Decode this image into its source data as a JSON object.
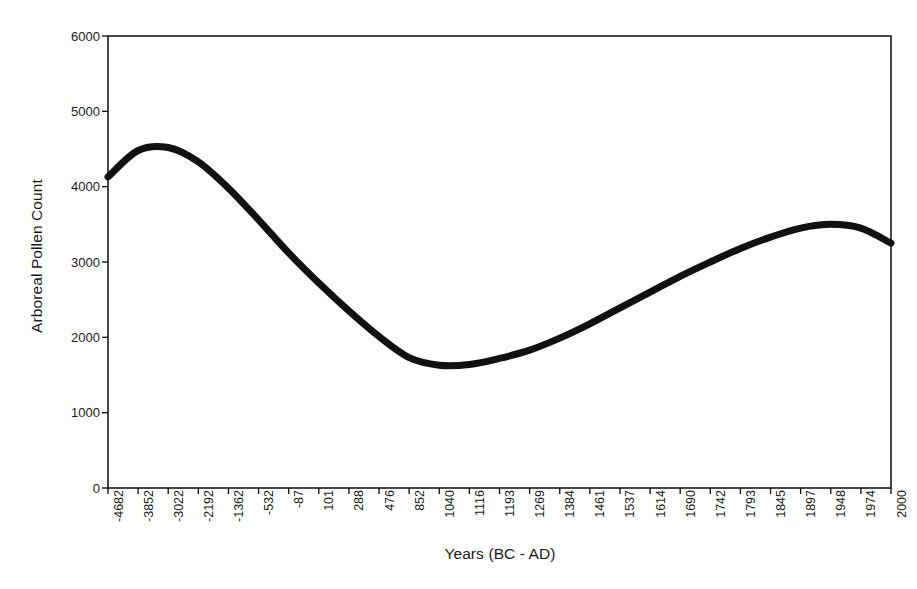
{
  "chart_data": {
    "type": "line",
    "title": "",
    "xlabel": "Years (BC - AD)",
    "ylabel": "Arboreal Pollen Count",
    "ylim": [
      0,
      6000
    ],
    "yticks": [
      0,
      1000,
      2000,
      3000,
      4000,
      5000,
      6000
    ],
    "ytick_labels": [
      "0",
      "1000",
      "2000",
      "3000",
      "4000",
      "5000",
      "6000"
    ],
    "grid": false,
    "legend": "none",
    "line_color": "#111111",
    "line_width": 7,
    "categories": [
      "-4682",
      "-3852",
      "-3022",
      "-2192",
      "-1362",
      "-532",
      "-87",
      "101",
      "288",
      "476",
      "852",
      "1040",
      "1116",
      "1193",
      "1269",
      "1384",
      "1461",
      "1537",
      "1614",
      "1690",
      "1742",
      "1793",
      "1845",
      "1897",
      "1948",
      "1974",
      "2000"
    ],
    "series": [
      {
        "name": "Arboreal Pollen Count",
        "values": [
          4130,
          4480,
          4520,
          4330,
          3980,
          3560,
          3120,
          2720,
          2350,
          2010,
          1730,
          1630,
          1640,
          1720,
          1830,
          1990,
          2180,
          2390,
          2600,
          2810,
          3000,
          3180,
          3330,
          3450,
          3500,
          3450,
          3250
        ]
      }
    ]
  },
  "axes": {
    "plot_left": 108,
    "plot_right": 891,
    "plot_top": 36,
    "plot_bottom": 488,
    "border_color": "#1a1a1a"
  }
}
